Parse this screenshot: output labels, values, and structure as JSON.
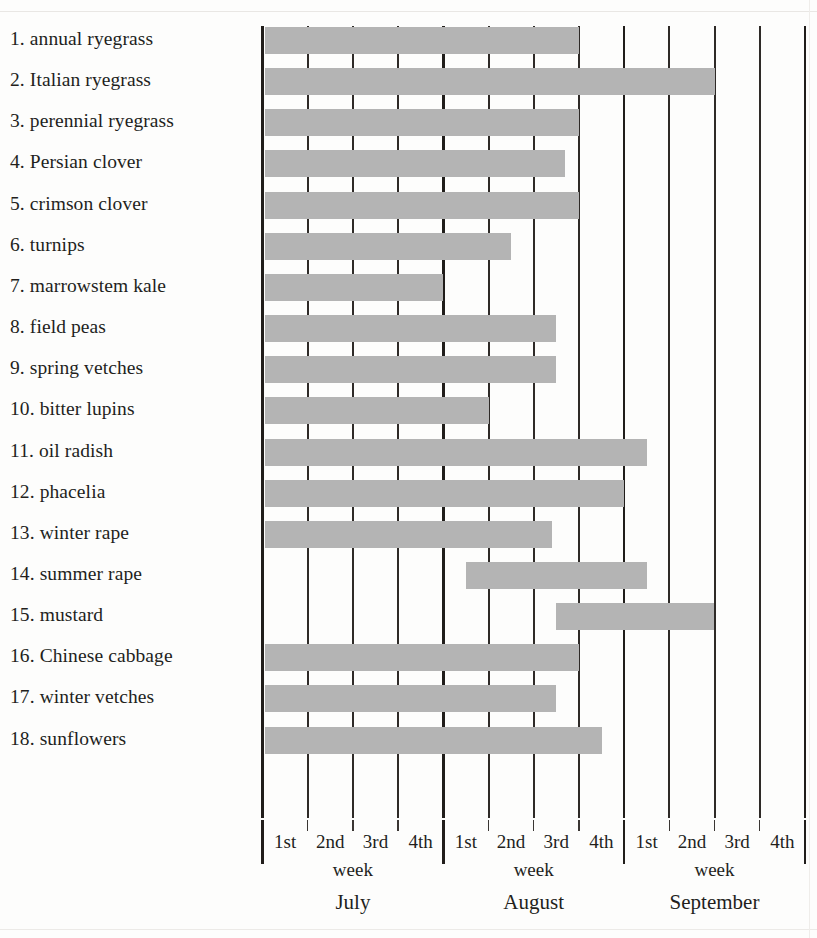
{
  "chart_data": {
    "type": "bar",
    "orientation": "horizontal",
    "title": "",
    "xlabel": "",
    "ylabel": "",
    "grid": true,
    "legend": null,
    "axis": {
      "months": [
        "July",
        "August",
        "September"
      ],
      "week_labels": [
        "1st",
        "2nd",
        "3rd",
        "4th"
      ],
      "week_word": "week",
      "total_weeks": 12,
      "x_min_week": 0,
      "x_max_week": 12
    },
    "note": "Each bar spans a sowing window measured in weeks from the start of July (week 0) to the end of September (week 12).",
    "categories": [
      "1. annual ryegrass",
      "2. Italian ryegrass",
      "3. perennial ryegrass",
      "4. Persian clover",
      "5. crimson clover",
      "6. turnips",
      "7. marrowstem kale",
      "8. field peas",
      "9. spring vetches",
      "10. bitter lupins",
      "11. oil radish",
      "12. phacelia",
      "13. winter rape",
      "14. summer rape",
      "15. mustard",
      "16. Chinese cabbage",
      "17. winter vetches",
      "18. sunflowers"
    ],
    "bars": [
      {
        "index": 1,
        "label": "1. annual ryegrass",
        "start_week": 0,
        "end_week": 7
      },
      {
        "index": 2,
        "label": "2. Italian ryegrass",
        "start_week": 0,
        "end_week": 10
      },
      {
        "index": 3,
        "label": "3. perennial ryegrass",
        "start_week": 0,
        "end_week": 7
      },
      {
        "index": 4,
        "label": "4. Persian clover",
        "start_week": 0,
        "end_week": 6.7
      },
      {
        "index": 5,
        "label": "5. crimson clover",
        "start_week": 0,
        "end_week": 7
      },
      {
        "index": 6,
        "label": "6. turnips",
        "start_week": 0,
        "end_week": 5.5
      },
      {
        "index": 7,
        "label": "7. marrowstem kale",
        "start_week": 0,
        "end_week": 4
      },
      {
        "index": 8,
        "label": "8. field peas",
        "start_week": 0,
        "end_week": 6.5
      },
      {
        "index": 9,
        "label": "9. spring vetches",
        "start_week": 0,
        "end_week": 6.5
      },
      {
        "index": 10,
        "label": "10. bitter lupins",
        "start_week": 0,
        "end_week": 5
      },
      {
        "index": 11,
        "label": "11. oil radish",
        "start_week": 0,
        "end_week": 8.5
      },
      {
        "index": 12,
        "label": "12. phacelia",
        "start_week": 0,
        "end_week": 8
      },
      {
        "index": 13,
        "label": "13. winter rape",
        "start_week": 0,
        "end_week": 6.4
      },
      {
        "index": 14,
        "label": "14. summer rape",
        "start_week": 4.5,
        "end_week": 8.5
      },
      {
        "index": 15,
        "label": "15. mustard",
        "start_week": 6.5,
        "end_week": 10
      },
      {
        "index": 16,
        "label": "16. Chinese cabbage",
        "start_week": 0,
        "end_week": 7
      },
      {
        "index": 17,
        "label": "17. winter vetches",
        "start_week": 0,
        "end_week": 6.5
      },
      {
        "index": 18,
        "label": "18. sunflowers",
        "start_week": 0,
        "end_week": 7.5
      }
    ],
    "colors": {
      "bar_fill": "#b4b4b4",
      "gridline": "#2e2a27",
      "divider": "#211e1b",
      "text": "#231f1c",
      "background": "#fdfdfc"
    }
  },
  "axis_text": {
    "weeks": [
      {
        "month": "July",
        "label": "1st"
      },
      {
        "month": "July",
        "label": "2nd"
      },
      {
        "month": "July",
        "label": "3rd"
      },
      {
        "month": "July",
        "label": "4th"
      },
      {
        "month": "August",
        "label": "1st"
      },
      {
        "month": "August",
        "label": "2nd"
      },
      {
        "month": "August",
        "label": "3rd"
      },
      {
        "month": "August",
        "label": "4th"
      },
      {
        "month": "September",
        "label": "1st"
      },
      {
        "month": "September",
        "label": "2nd"
      },
      {
        "month": "September",
        "label": "3rd"
      },
      {
        "month": "September",
        "label": "4th"
      }
    ],
    "week_word_july": "week",
    "week_word_august": "week",
    "week_word_september": "week",
    "month_july": "July",
    "month_august": "August",
    "month_september": "September"
  }
}
